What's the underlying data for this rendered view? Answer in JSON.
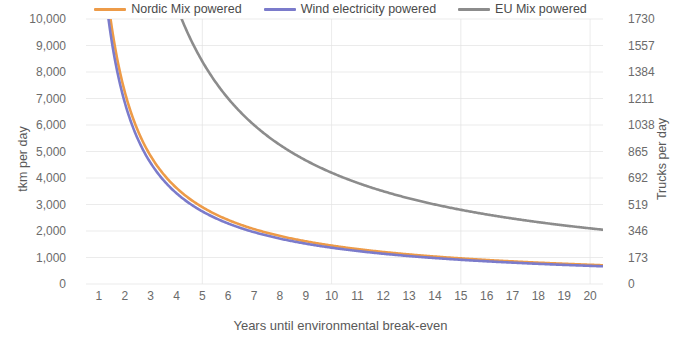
{
  "chart_data": {
    "type": "line",
    "title": "",
    "xlabel": "Years until environmental break-even",
    "ylabel": "tkm per day",
    "ylabel_secondary": "Trucks per day",
    "grid": true,
    "legend_position": "top",
    "xlim": [
      0.5,
      20.5
    ],
    "ylim": [
      0,
      10000
    ],
    "ylim_secondary": [
      0,
      1730
    ],
    "x_ticks": [
      "1",
      "2",
      "3",
      "4",
      "5",
      "6",
      "7",
      "8",
      "9",
      "10",
      "11",
      "12",
      "13",
      "14",
      "15",
      "16",
      "17",
      "18",
      "19",
      "20"
    ],
    "y_ticks_left": [
      "0",
      "1,000",
      "2,000",
      "3,000",
      "4,000",
      "5,000",
      "6,000",
      "7,000",
      "8,000",
      "9,000",
      "10,000"
    ],
    "y_ticks_right": [
      "0",
      "173",
      "346",
      "519",
      "692",
      "865",
      "1038",
      "1211",
      "1384",
      "1557",
      "1730"
    ],
    "x": [
      1,
      2,
      3,
      4,
      5,
      6,
      7,
      8,
      9,
      10,
      11,
      12,
      13,
      14,
      15,
      16,
      17,
      18,
      19,
      20
    ],
    "series": [
      {
        "name": "Nordic Mix powered",
        "color": "#ED9B48",
        "axis": "left",
        "values": [
          14500,
          7250,
          4833,
          3625,
          2900,
          2417,
          2071,
          1813,
          1611,
          1450,
          1318,
          1208,
          1115,
          1036,
          967,
          906,
          853,
          806,
          763,
          725
        ]
      },
      {
        "name": "Wind electricity powered",
        "color": "#7B7BCB",
        "axis": "left",
        "values": [
          13700,
          6850,
          4567,
          3425,
          2740,
          2283,
          1957,
          1713,
          1522,
          1370,
          1245,
          1142,
          1054,
          979,
          913,
          856,
          806,
          761,
          721,
          685
        ]
      },
      {
        "name": "EU Mix powered",
        "color": "#8C8C8C",
        "axis": "left",
        "values": [
          42000,
          21000,
          14000,
          10500,
          8400,
          7000,
          6000,
          5250,
          4667,
          4200,
          3818,
          3500,
          3231,
          3000,
          2800,
          2625,
          2471,
          2333,
          2211,
          2100
        ]
      }
    ]
  },
  "legend": {
    "items": [
      {
        "label": "Nordic Mix powered",
        "color": "#ED9B48"
      },
      {
        "label": "Wind electricity powered",
        "color": "#7B7BCB"
      },
      {
        "label": "EU Mix powered",
        "color": "#8C8C8C"
      }
    ]
  }
}
